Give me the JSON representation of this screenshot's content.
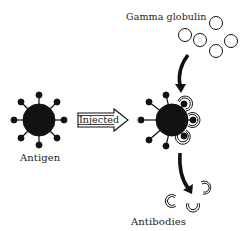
{
  "diagram": {
    "type": "process-illustration",
    "labels": {
      "antigen": "Antigen",
      "injected": "Injected",
      "gamma_globulin": "Gamma globulin",
      "antibodies": "Antibodies"
    },
    "nodes": [
      {
        "id": "antigen-left",
        "label": "Antigen",
        "shape": "spiked-sphere"
      },
      {
        "id": "antigen-right",
        "label": "",
        "shape": "spiked-sphere-with-bound-antibodies"
      },
      {
        "id": "gamma-globulin",
        "label": "Gamma globulin",
        "shape": "cluster-of-5-circles"
      },
      {
        "id": "antibodies",
        "label": "Antibodies",
        "shape": "three-c-shaped-antibodies"
      }
    ],
    "edges": [
      {
        "from": "antigen-left",
        "to": "antigen-right",
        "label": "Injected",
        "style": "hollow-arrow"
      },
      {
        "from": "gamma-globulin",
        "to": "antigen-right",
        "label": "",
        "style": "curved-solid-arrow"
      },
      {
        "from": "antigen-right",
        "to": "antibodies",
        "label": "",
        "style": "curved-solid-arrow"
      }
    ],
    "colors": {
      "ink": "#111111",
      "background": "#ffffff"
    }
  }
}
